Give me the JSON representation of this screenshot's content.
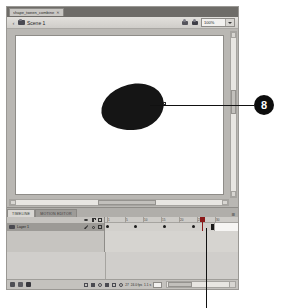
{
  "window": {
    "document_tab": {
      "title": "shape_tween_combine",
      "close_icon": "close-icon"
    }
  },
  "edit_bar": {
    "back_arrow_icon": "back-arrow-icon",
    "scene_icon": "scene-icon",
    "scene_label": "Scene 1",
    "edit_scene_icon": "edit-scene-icon",
    "edit_symbol_icon": "edit-symbol-icon",
    "zoom_value": "100%",
    "zoom_dropdown_icon": "chevron-down-icon"
  },
  "stage": {
    "shape_name": "black-teardrop-shape",
    "anchor_point_name": "shape-anchor-point",
    "vertical_scrollbar": "stage-vertical-scrollbar",
    "horizontal_scrollbar": "stage-horizontal-scrollbar"
  },
  "timeline": {
    "tabs": [
      {
        "label": "TIMELINE",
        "active": true
      },
      {
        "label": "MOTION EDITOR",
        "active": false
      }
    ],
    "panel_menu_icon": "panel-menu-icon",
    "layer_columns": [
      {
        "icon": "eye-icon"
      },
      {
        "icon": "lock-icon"
      },
      {
        "icon": "outline-square-icon"
      }
    ],
    "layer": {
      "icon": "layer-icon",
      "name": "Layer 1",
      "edit_icon": "pencil-icon",
      "visibility_icon": "visibility-dot-icon",
      "outline_icon": "outline-square-icon"
    },
    "ruler_labels": [
      "1",
      "5",
      "10",
      "15",
      "20",
      "25",
      "30"
    ],
    "keyframes": [
      {
        "frame": 1,
        "type": "keyframe"
      },
      {
        "frame": 9,
        "type": "keyframe"
      },
      {
        "frame": 17,
        "type": "keyframe"
      },
      {
        "frame": 25,
        "type": "keyframe"
      },
      {
        "frame": 30,
        "type": "end-frame"
      }
    ],
    "playhead_frame": 27,
    "status": {
      "new_layer_icon": "new-layer-icon",
      "new_folder_icon": "new-folder-icon",
      "delete_layer_icon": "trash-icon",
      "first_frame_icon": "first-frame-icon",
      "prev_frame_icon": "previous-frame-icon",
      "play_icon": "play-icon",
      "next_frame_icon": "next-frame-icon",
      "last_frame_icon": "last-frame-icon",
      "loop_icon": "loop-icon",
      "onion_skin_icon": "onion-skin-icon",
      "current_frame": "27",
      "fps": "24.0 fps",
      "elapsed": "1.1 s",
      "frame_field": "27"
    }
  },
  "annotations": {
    "callouts": [
      {
        "number": "8",
        "target": "shape-anchor-point"
      }
    ],
    "leader_lines": [
      {
        "name": "callout-8-leader-line",
        "orientation": "horizontal"
      },
      {
        "name": "timeline-playhead-leader-line",
        "orientation": "vertical"
      }
    ]
  }
}
